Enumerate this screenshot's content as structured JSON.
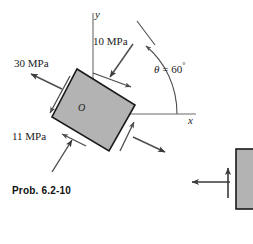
{
  "figure": {
    "caption": "Prob. 6.2-10",
    "origin_label": "O",
    "axes": {
      "x_label": "x",
      "y_label": "y"
    },
    "angle": {
      "symbol": "θ",
      "equals": "=",
      "value": "60",
      "unit": "°",
      "full": "θ = 60°"
    },
    "stresses": [
      {
        "name": "normal-stress-top",
        "label": "10 MPa",
        "value": 10,
        "unit": "MPa"
      },
      {
        "name": "normal-stress-left",
        "label": "30 MPa",
        "value": 30,
        "unit": "MPa"
      },
      {
        "name": "shear-stress",
        "label": "11 MPa",
        "value": 11,
        "unit": "MPa"
      }
    ],
    "element": {
      "rotation_deg": 60,
      "fill_color": "#b3b3b3",
      "stroke_color": "#1a1a1a"
    },
    "colors": {
      "ink": "#1a1a1a",
      "gray_fill": "#b3b3b3",
      "arrow": "#4d4d4d",
      "axis": "#6b6b6b",
      "background": "#ffffff"
    },
    "side_element": {
      "name": "adjacent-figure-fragment",
      "fill_color": "#b3b3b3"
    }
  }
}
